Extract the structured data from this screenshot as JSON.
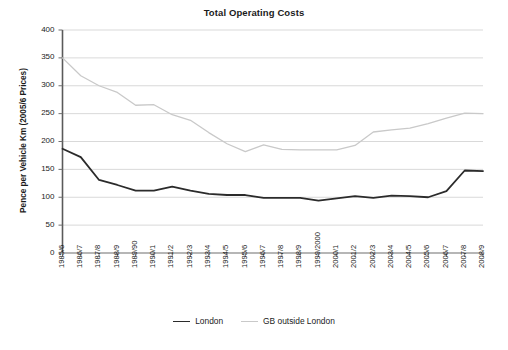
{
  "chart_data": {
    "type": "line",
    "title": "Total Operating Costs",
    "xlabel": "",
    "ylabel": "Pence per Vehicle Km (2005/6 Prices)",
    "ylim": [
      0,
      400
    ],
    "ytick_step": 50,
    "yticks": [
      "400",
      "350",
      "300",
      "250",
      "200",
      "150",
      "100",
      "50",
      "0"
    ],
    "grid": true,
    "grid_axis": "y",
    "legend_position": "bottom",
    "categories": [
      "1985/6",
      "1986/7",
      "1987/8",
      "1988/9",
      "1989/90",
      "1990/1",
      "1991/2",
      "1992/3",
      "1993/4",
      "1994/5",
      "1995/6",
      "1996/7",
      "1997/8",
      "1998/9",
      "1999/2000",
      "2000/1",
      "2001/2",
      "2002/3",
      "2003/4",
      "2004/5",
      "2005/6",
      "2006/7",
      "2007/8",
      "2008/9"
    ],
    "series": [
      {
        "name": "London",
        "color": "#2b2b2b",
        "values": [
          187,
          172,
          131,
          122,
          112,
          112,
          119,
          112,
          106,
          104,
          104,
          99,
          99,
          99,
          94,
          98,
          102,
          99,
          103,
          102,
          100,
          111,
          148,
          147
        ]
      },
      {
        "name": "GB outside London",
        "color": "#c9c9c9",
        "values": [
          350,
          318,
          300,
          288,
          265,
          266,
          248,
          238,
          216,
          196,
          182,
          194,
          186,
          185,
          185,
          185,
          193,
          217,
          221,
          224,
          232,
          242,
          251,
          250
        ]
      }
    ]
  },
  "legend": {
    "items": [
      {
        "label": "London",
        "icon": "line-swatch-dark"
      },
      {
        "label": "GB outside London",
        "icon": "line-swatch-light"
      }
    ]
  }
}
